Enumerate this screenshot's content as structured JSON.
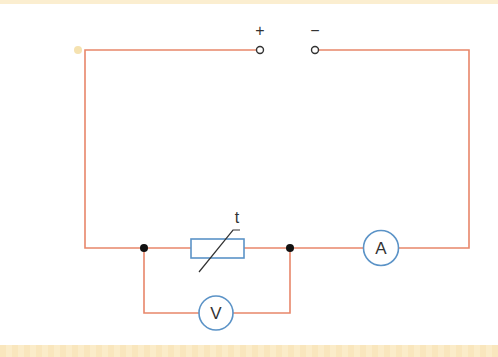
{
  "diagram": {
    "type": "circuit",
    "colors": {
      "wire": "#e8866a",
      "component_outline": "#5b93c7",
      "junction": "#111111",
      "text": "#333333",
      "background": "#ffffff",
      "border": "#fbeed0"
    },
    "terminals": {
      "positive_label": "+",
      "negative_label": "−"
    },
    "thermistor": {
      "label": "t"
    },
    "ammeter": {
      "label": "A"
    },
    "voltmeter": {
      "label": "V"
    }
  }
}
